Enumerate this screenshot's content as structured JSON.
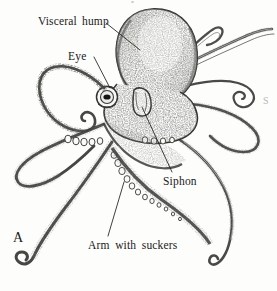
{
  "figure": {
    "kind": "scientific-illustration",
    "panel_label": "A",
    "background_color": "#fdfdfc",
    "ink_color": "#1a1a18",
    "edge_artifact": "S"
  },
  "labels": [
    {
      "id": "visceral_hump",
      "text": "Visceral hump"
    },
    {
      "id": "eye",
      "text": "Eye"
    },
    {
      "id": "siphon",
      "text": "Siphon"
    },
    {
      "id": "arm_with_suckers",
      "text": "Arm with suckers"
    }
  ],
  "annotations": {
    "visceral_hump": "Visceral hump",
    "eye": "Eye",
    "siphon": "Siphon",
    "arm_with_suckers": "Arm with suckers",
    "panel": "A",
    "edge_mark": "S"
  }
}
